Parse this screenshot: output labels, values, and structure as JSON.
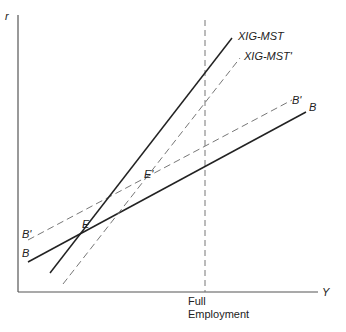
{
  "diagram": {
    "axes": {
      "y_label": "r",
      "x_label": "Y",
      "color": "#444444"
    },
    "full_employment": {
      "label_line1": "Full",
      "label_line2": "Employment",
      "x": 205
    },
    "curves": [
      {
        "name": "XIG-MST",
        "style": "solid",
        "label": "XIG-MST",
        "x1": 50,
        "y1": 273,
        "x2": 232,
        "y2": 38
      },
      {
        "name": "XIG-MST'",
        "style": "dashed",
        "label": "XIG-MST'",
        "x1": 63,
        "y1": 284,
        "x2": 240,
        "y2": 58
      },
      {
        "name": "B",
        "style": "solid",
        "label": "B",
        "x1": 28,
        "y1": 262,
        "x2": 306,
        "y2": 112
      },
      {
        "name": "B'",
        "style": "dashed",
        "label": "B'",
        "x1": 28,
        "y1": 240,
        "x2": 292,
        "y2": 100
      }
    ],
    "points": [
      {
        "label": "E"
      },
      {
        "label": "E'"
      }
    ],
    "left_labels": {
      "b_prime": "B'",
      "b": "B"
    },
    "line_color": "#222222",
    "dash_color": "#777777"
  }
}
